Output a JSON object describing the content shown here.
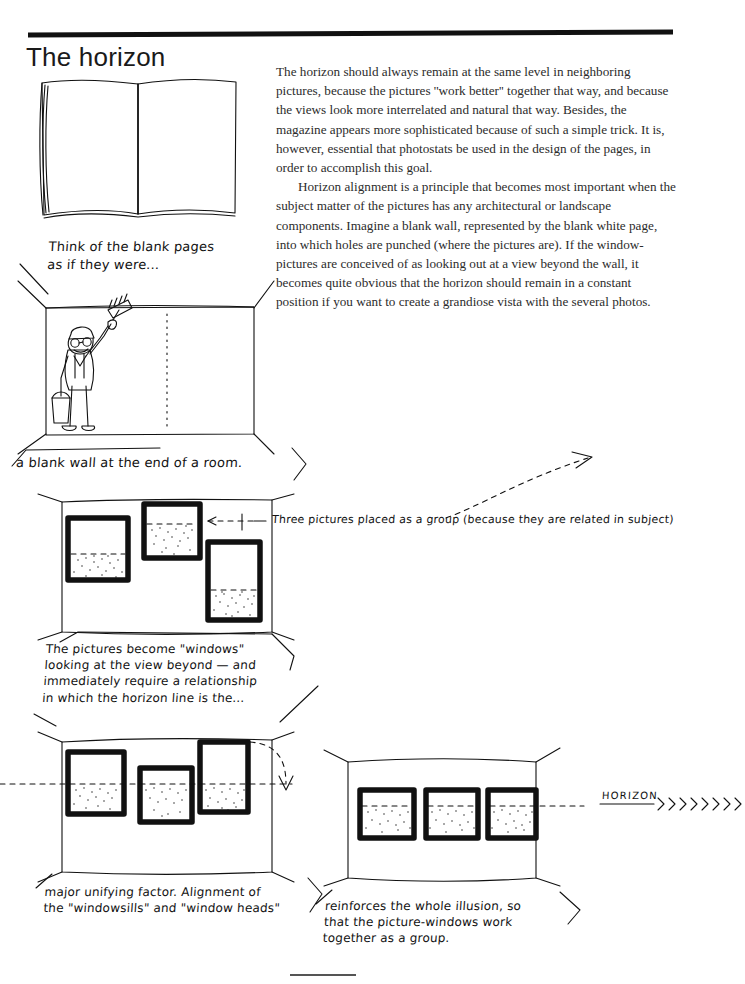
{
  "page": {
    "title": "The horizon",
    "width": 745,
    "height": 984,
    "ink_color": "#111111",
    "paper_color": "#ffffff"
  },
  "body": {
    "paragraph_1": "The horizon should always remain at the same level in neighboring pictures, because the pictures ''work better'' together that way, and because the views look more interrelated and natural that way. Besides, the magazine appears more sophisticated because of such a simple trick. It is, however, essential that photostats be used in the design of the pages, in order to accomplish this goal.",
    "paragraph_2": "Horizon alignment is a principle that becomes most important when the subject matter of the pictures has any architectural or landscape components. Imagine a blank wall, represented by the blank white page, into which holes are punched (where the pictures are). If the window-pictures are conceived of as looking out at a view beyond the wall, it becomes quite obvious that the horizon should remain in a constant position if you want to create a grandiose vista with the several photos."
  },
  "captions": {
    "blank_pages": "Think of the blank pages\nas if they were...",
    "blank_wall": "a blank wall at the end of a room.",
    "three_pictures": "Three pictures placed as a group (because they are related in subject)",
    "windows": "The pictures become \"windows\"\nlooking at the view beyond — and\nimmediately require a relationship\nin which the horizon line is the...",
    "unifying": "major unifying factor. Alignment of\nthe \"windowsills\" and \"window heads\"",
    "reinforces": "reinforces the whole illusion, so\nthat the picture-windows work\ntogether as a group.",
    "horizon_label": "HORIZON"
  },
  "figures": {
    "open_book": "open-book-blank-spread",
    "painter_room": "room-with-painter-and-blank-wall",
    "unaligned_group": "three-pictures-unaligned",
    "aligned_left": "three-pictures-aligned-on-horizon",
    "aligned_right": "three-windows-aligned-sills-and-heads"
  }
}
